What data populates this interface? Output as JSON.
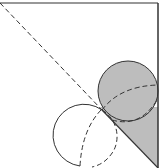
{
  "diagram": {
    "type": "geometry",
    "colors": {
      "stroke": "#333333",
      "shade": "#bdbdbd",
      "background": "#ffffff"
    },
    "frame": {
      "top_y": 3,
      "right_x": 158,
      "bottom_y": 168
    },
    "diagonal": {
      "x1": 0,
      "y1": 3,
      "x2": 158,
      "y2": 168
    },
    "shaded_circle": {
      "cx": 128,
      "cy": 91,
      "r": 30
    },
    "open_circle": {
      "cx": 86,
      "cy": 135,
      "r": 31
    },
    "dashed_arcs": [
      "upper dashed arc across shaded circle",
      "lower dashed arc within open circle"
    ]
  }
}
